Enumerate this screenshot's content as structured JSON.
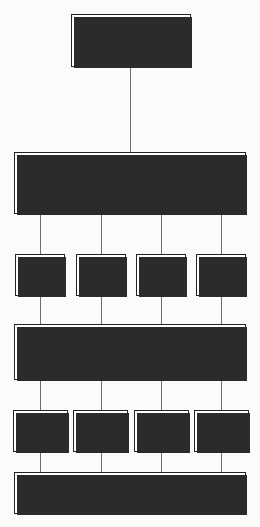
{
  "diagram": {
    "colors": {
      "background": "#fbfbf9",
      "box_fill": "#ffffff",
      "box_stroke": "#242424",
      "shadow": "#2b2b2b",
      "connector": "#6d6d6d",
      "text": "#2a2a2a"
    },
    "levels": [
      {
        "id": "source",
        "boxes": [
          {
            "id": "colour-original",
            "lines": [
              "Colour",
              "original"
            ]
          }
        ]
      },
      {
        "id": "light",
        "boxes": [
          {
            "id": "light-transmitted",
            "lines": [
              "Light transmitted/",
              "reflected from",
              "original"
            ]
          }
        ]
      },
      {
        "id": "filters",
        "boxes": [
          {
            "id": "filter-blue",
            "lines": [
              "Blue",
              "filter"
            ]
          },
          {
            "id": "filter-green",
            "lines": [
              "Green",
              "filter"
            ]
          },
          {
            "id": "filter-red",
            "lines": [
              "Red",
              "filter"
            ]
          },
          {
            "id": "filter-gold",
            "lines": [
              "‘Gold’",
              "filter"
            ]
          }
        ]
      },
      {
        "id": "filtered-light",
        "boxes": [
          {
            "id": "filtered-light",
            "lines": [
              "Filtered light trans-",
              "mitted from filter",
              "to film"
            ]
          }
        ]
      },
      {
        "id": "separations",
        "boxes": [
          {
            "id": "sep-yellow",
            "lines": [
              "Yellow"
            ]
          },
          {
            "id": "sep-magenta",
            "lines": [
              "Magenta",
              "(red)"
            ]
          },
          {
            "id": "sep-cyan",
            "lines": [
              "Cyan",
              "(blue)"
            ]
          },
          {
            "id": "sep-black",
            "lines": [
              "Black"
            ]
          }
        ]
      },
      {
        "id": "output",
        "boxes": [
          {
            "id": "separation-positives",
            "lines": [
              "Separation positives",
              "or negatives"
            ]
          }
        ]
      }
    ]
  }
}
